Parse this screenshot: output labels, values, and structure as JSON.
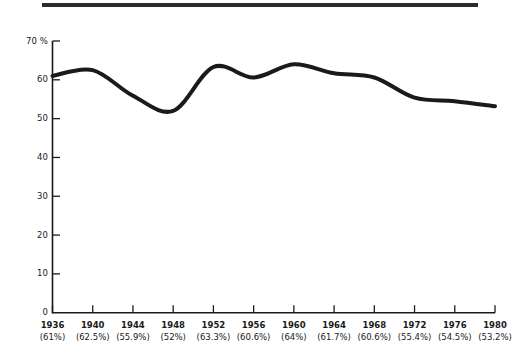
{
  "chart_data": {
    "type": "line",
    "title": "",
    "subtitle": "",
    "xlabel": "",
    "ylabel": "70 %",
    "categories": [
      "1936",
      "1940",
      "1944",
      "1948",
      "1952",
      "1956",
      "1960",
      "1964",
      "1968",
      "1972",
      "1976",
      "1980"
    ],
    "values": [
      61,
      62.5,
      55.9,
      52,
      63.3,
      60.6,
      64,
      61.7,
      60.6,
      55.4,
      54.5,
      53.2
    ],
    "value_labels": [
      "(61%)",
      "(62.5%)",
      "(55.9%)",
      "(52%)",
      "(63.3%)",
      "(60.6%)",
      "(64%)",
      "(61.7%)",
      "(60.6%)",
      "(55.4%)",
      "(54.5%)",
      "(53.2%)"
    ],
    "ylim": [
      0,
      70
    ],
    "xlim": [
      "1936",
      "1980"
    ],
    "yticks": [
      0,
      10,
      20,
      30,
      40,
      50,
      60,
      70
    ],
    "ytick_labels": [
      "0",
      "10",
      "20",
      "30",
      "40",
      "50",
      "60",
      "70 %"
    ],
    "grid": false,
    "legend": null,
    "line_color": "#1a1a1a",
    "line_width": 4,
    "axis_color": "#1a1a1a",
    "rule_color": "#2b2b2b"
  },
  "axis": {
    "y_labels": [
      "70 %",
      "60",
      "50",
      "40",
      "30",
      "20",
      "10",
      "0"
    ]
  },
  "ticks": [
    {
      "year": "1936",
      "value": "(61%)"
    },
    {
      "year": "1940",
      "value": "(62.5%)"
    },
    {
      "year": "1944",
      "value": "(55.9%)"
    },
    {
      "year": "1948",
      "value": "(52%)"
    },
    {
      "year": "1952",
      "value": "(63.3%)"
    },
    {
      "year": "1956",
      "value": "(60.6%)"
    },
    {
      "year": "1960",
      "value": "(64%)"
    },
    {
      "year": "1964",
      "value": "(61.7%)"
    },
    {
      "year": "1968",
      "value": "(60.6%)"
    },
    {
      "year": "1972",
      "value": "(55.4%)"
    },
    {
      "year": "1976",
      "value": "(54.5%)"
    },
    {
      "year": "1980",
      "value": "(53.2%)"
    }
  ]
}
